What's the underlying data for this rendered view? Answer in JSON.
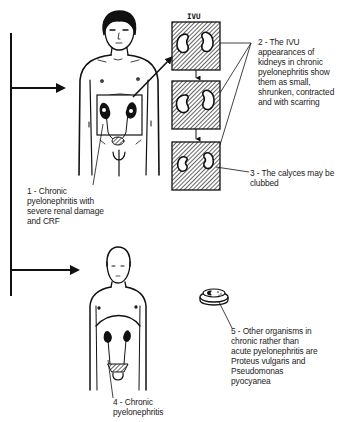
{
  "diagram": {
    "ivu_title": "IVU",
    "labels": [
      {
        "id": "1",
        "lines": [
          "1 - Chronic",
          "pyelonephritis with",
          "severe renal damage",
          "and CRF"
        ]
      },
      {
        "id": "2",
        "lines": [
          "2 - The IVU",
          "appearances of",
          "kidneys in chronic",
          "pyelonephritis show",
          "them as small,",
          "shrunken, contracted",
          "and with scarring"
        ]
      },
      {
        "id": "3",
        "lines": [
          "3 - The calyces may be",
          "clubbed"
        ]
      },
      {
        "id": "4",
        "lines": [
          "4 - Chronic",
          "pyelonephritis"
        ]
      },
      {
        "id": "5",
        "lines": [
          "5 - Other organisms in",
          "chronic rather than",
          "acute pyelonephritis are",
          "Proteus vulgaris and",
          "Pseudomonas",
          "pyocyanea"
        ]
      }
    ],
    "colors": {
      "ink": "#111111",
      "background": "#ffffff",
      "text": "#222222"
    }
  }
}
